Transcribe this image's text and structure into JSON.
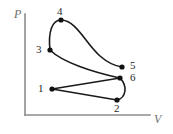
{
  "figure": {
    "title": "",
    "type": "pv-cycle-diagram",
    "width": 173,
    "height": 134,
    "background": "#ffffff"
  },
  "axes": {
    "x": {
      "label": "V",
      "label_pos": [
        154,
        113
      ],
      "line": {
        "x1": 25,
        "y1": 115,
        "x2": 150,
        "y2": 115
      },
      "color": "#8c8c8c",
      "ticks": [],
      "arrow": false
    },
    "y": {
      "label": "P",
      "label_pos": [
        14,
        8
      ],
      "line": {
        "x1": 25,
        "y1": 14,
        "x2": 25,
        "y2": 115
      },
      "color": "#8c8c8c",
      "ticks": [],
      "arrow": false
    }
  },
  "style": {
    "curve_color": "#1a1a1a",
    "curve_width": 1.6,
    "marker_color": "#111111",
    "marker_radius": 2.6,
    "label_color": "#2a2a2a",
    "axis_color": "#8c8c8c"
  },
  "chart_data": {
    "type": "line",
    "title": "",
    "xlabel": "V",
    "ylabel": "P",
    "grid": false,
    "legend": null,
    "axis_ranges": {
      "x": [
        25,
        150
      ],
      "y": [
        14,
        115
      ]
    },
    "points": [
      {
        "id": "1",
        "x": 52,
        "y": 89,
        "label": "1",
        "label_x": 38,
        "label_y": 83
      },
      {
        "id": "2",
        "x": 117,
        "y": 100,
        "label": "2",
        "label_x": 114,
        "label_y": 103
      },
      {
        "id": "3",
        "x": 50,
        "y": 50,
        "label": "3",
        "label_x": 36,
        "label_y": 44
      },
      {
        "id": "4",
        "x": 61,
        "y": 20,
        "label": "4",
        "label_x": 57,
        "label_y": 6
      },
      {
        "id": "5",
        "x": 122,
        "y": 67,
        "label": "5",
        "label_x": 130,
        "label_y": 60
      },
      {
        "id": "6",
        "x": 120,
        "y": 78,
        "label": "6",
        "label_x": 130,
        "label_y": 72
      }
    ],
    "segments": [
      {
        "name": "1-2",
        "from": "1",
        "to": "2",
        "kind": "line",
        "path": "M 52 89 L 117 100"
      },
      {
        "name": "2-6",
        "from": "2",
        "to": "6",
        "kind": "curve",
        "path": "M 117 100 C 126 98 128 86 120 78"
      },
      {
        "name": "6-1",
        "from": "6",
        "to": "1",
        "kind": "line",
        "path": "M 120 78 L 52 89"
      },
      {
        "name": "3-6",
        "from": "3",
        "to": "6",
        "kind": "curve",
        "path": "M 50 50 C 62 62 92 72 120 78"
      },
      {
        "name": "3-4",
        "from": "3",
        "to": "4",
        "kind": "curve",
        "path": "M 50 50 C 48 32 52 20 61 20"
      },
      {
        "name": "4-5",
        "from": "4",
        "to": "5",
        "kind": "curve",
        "path": "M 61 20 C 76 20 86 44 100 56 C 108 63 115 66 122 67"
      }
    ]
  }
}
